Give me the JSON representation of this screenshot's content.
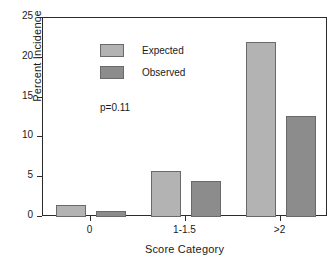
{
  "chart_data": {
    "type": "bar",
    "title": "",
    "xlabel": "Score Category",
    "ylabel": "Percent Incidence",
    "categories": [
      "0",
      "1-1.5",
      ">2"
    ],
    "series": [
      {
        "name": "Expected",
        "values": [
          1.5,
          5.8,
          22.0
        ],
        "color": "#b3b3b3"
      },
      {
        "name": "Observed",
        "values": [
          0.8,
          4.5,
          12.7
        ],
        "color": "#8c8c8c"
      }
    ],
    "ylim": [
      0,
      25
    ],
    "yticks": [
      0,
      5,
      10,
      15,
      20,
      25
    ],
    "ytick_labels": [
      "0",
      "5",
      "10",
      "15",
      "20",
      "25"
    ],
    "grid": false,
    "legend_position": "upper-left",
    "annotations": [
      {
        "name": "p-value",
        "text": "p=0.11"
      }
    ]
  },
  "legend": {
    "items": [
      {
        "label": "Expected"
      },
      {
        "label": "Observed"
      }
    ]
  },
  "annotation": {
    "pvalue": "p=0.11"
  }
}
